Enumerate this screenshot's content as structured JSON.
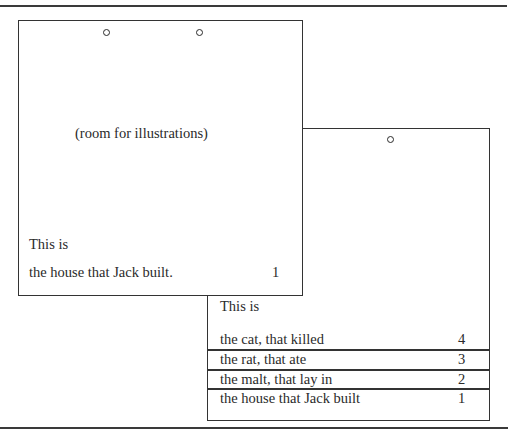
{
  "page": {
    "top_rule": true,
    "bottom_rule": true
  },
  "front_card": {
    "placeholder": "(room for illustrations)",
    "intro": "This is",
    "line": "the house that Jack built.",
    "number": "1",
    "holes": 2
  },
  "back_card": {
    "intro": "This is",
    "holes": 1,
    "rows": [
      {
        "text": "the cat, that killed",
        "number": "4"
      },
      {
        "text": "the rat, that ate",
        "number": "3"
      },
      {
        "text": "the malt, that lay in",
        "number": "2"
      },
      {
        "text": "the house that Jack built",
        "number": "1"
      }
    ]
  }
}
